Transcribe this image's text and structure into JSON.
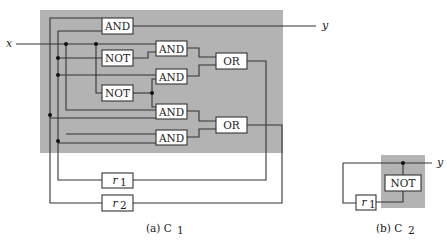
{
  "figure": {
    "c1": {
      "caption": "(a) C",
      "caption_sub": "1",
      "region_color": "#b3b3b3",
      "input_label": "x",
      "output_label": "y",
      "gates": {
        "and1": "AND",
        "not1": "NOT",
        "and2": "AND",
        "and3": "AND",
        "not2": "NOT",
        "and4": "AND",
        "and5": "AND",
        "or1": "OR",
        "or2": "OR"
      },
      "registers": {
        "r1": "r",
        "r1_sub": "1",
        "r2": "r",
        "r2_sub": "2"
      }
    },
    "c2": {
      "caption": "(b) C",
      "caption_sub": "2",
      "region_color": "#b3b3b3",
      "output_label": "y",
      "gates": {
        "not": "NOT"
      },
      "registers": {
        "r1": "r",
        "r1_sub": "1"
      }
    }
  }
}
